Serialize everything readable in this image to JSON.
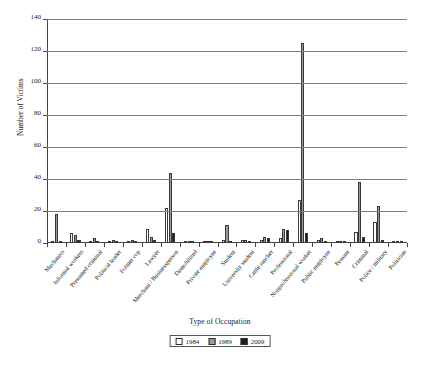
{
  "chart_data": {
    "type": "bar",
    "title": "",
    "xlabel": "Type of Occupation",
    "ylabel": "Number of Victims",
    "ylim": [
      0,
      140
    ],
    "yticks": [
      0,
      20,
      40,
      60,
      80,
      100,
      120,
      140
    ],
    "grid": true,
    "legend_position": "bottom-center",
    "categories": [
      "Mechanics",
      "Informal workers",
      "Presumed criminal",
      "Political leader",
      "Former cop",
      "Lawyer",
      "Merchant / Businessperson",
      "Demobilized",
      "Private employee",
      "Student",
      "University student",
      "Cattle rancher",
      "Professional",
      "Nonprofessional worker",
      "Public employee",
      "Peasant",
      "Criminal",
      "Police / military",
      "Politician"
    ],
    "series": [
      {
        "name": "1984",
        "color": "#ffffff",
        "values": [
          1,
          6,
          1,
          1,
          1,
          9,
          22,
          1,
          1,
          2,
          2,
          2,
          3,
          27,
          2,
          1,
          7,
          13,
          1
        ]
      },
      {
        "name": "1989",
        "color": "#9a9a9a",
        "values": [
          18,
          5,
          3,
          2,
          2,
          4,
          44,
          0,
          1,
          11,
          2,
          4,
          9,
          125,
          3,
          1,
          38,
          23,
          1
        ]
      },
      {
        "name": "2009",
        "color": "#1c1c1c",
        "values": [
          1,
          2,
          1,
          1,
          1,
          2,
          6,
          0,
          1,
          1,
          1,
          3,
          8,
          6,
          1,
          1,
          4,
          2,
          1
        ]
      }
    ]
  },
  "legend": {
    "entries": [
      {
        "label": "1984"
      },
      {
        "label": "1989"
      },
      {
        "label": "2009"
      }
    ]
  },
  "caption": {
    "text": ""
  }
}
